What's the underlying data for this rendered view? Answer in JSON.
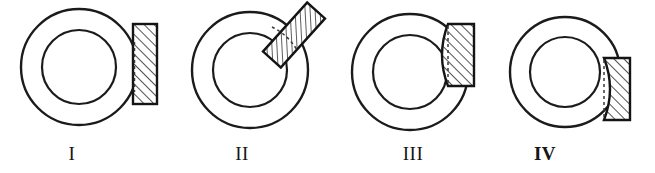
{
  "plate": {
    "title": "Annular ring figures with hatched block in four positions",
    "background_color": "#ffffff",
    "line_color": "#1b1b1b",
    "hatch_color": "#262626",
    "dashed_color": "#3a3a3a",
    "width": 655,
    "height": 173
  },
  "figures": [
    {
      "label": "I",
      "label_x": 72,
      "label_y": 146,
      "label_bold": false,
      "ring": {
        "cx": 79,
        "cy": 67,
        "outer_r": 58,
        "inner_r": 37
      },
      "block": {
        "kind": "straight-vertical",
        "x": 133,
        "y": 24,
        "width": 24,
        "height": 80,
        "rotation_deg": 0,
        "hatch_direction": "forward-slash",
        "dashed_edge": "left-vertical",
        "position_note": "tangent at right of outer circle, centered vertically"
      }
    },
    {
      "label": "II",
      "label_x": 242,
      "label_y": 146,
      "label_bold": false,
      "ring": {
        "cx": 250,
        "cy": 70,
        "outer_r": 58,
        "inner_r": 37
      },
      "block": {
        "kind": "straight-rotated",
        "x": 282,
        "y": 2,
        "width": 24,
        "height": 66,
        "rotation_deg": 42,
        "hatch_direction": "forward-slash",
        "dashed_edge": "arc-left",
        "position_note": "tilted about 42 degrees, tangent on upper-right of outer circle"
      }
    },
    {
      "label": "III",
      "label_x": 413,
      "label_y": 146,
      "label_bold": false,
      "ring": {
        "cx": 410,
        "cy": 72,
        "outer_r": 58,
        "inner_r": 37
      },
      "block": {
        "kind": "curved-convex-left",
        "x": 448,
        "y": 24,
        "width": 26,
        "height": 62,
        "rotation_deg": 0,
        "hatch_direction": "forward-slash",
        "dashed_edge": "left-vertical",
        "position_note": "upper-right, left edge bulges left following circle arc"
      }
    },
    {
      "label": "IV",
      "label_x": 545,
      "label_y": 146,
      "label_bold": true,
      "ring": {
        "cx": 565,
        "cy": 72,
        "outer_r": 55,
        "inner_r": 35
      },
      "block": {
        "kind": "curved-concave-left",
        "x": 604,
        "y": 58,
        "width": 26,
        "height": 62,
        "rotation_deg": 0,
        "hatch_direction": "forward-slash",
        "dashed_edge": "left-vertical",
        "position_note": "lower-right, left edge hollowed inward around circle"
      }
    }
  ]
}
